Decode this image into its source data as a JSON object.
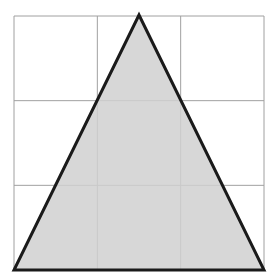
{
  "diagram": {
    "type": "triangle-on-grid",
    "grid": {
      "rows": 3,
      "cols": 3,
      "line_color": "#a0a0a0",
      "left": 14,
      "top": 16,
      "right": 264,
      "bottom": 270
    },
    "triangle": {
      "vertices": [
        [
          139,
          15
        ],
        [
          14,
          270
        ],
        [
          264,
          270
        ]
      ],
      "fill": "#d0d0d0",
      "stroke": "#1a1a1a"
    }
  }
}
